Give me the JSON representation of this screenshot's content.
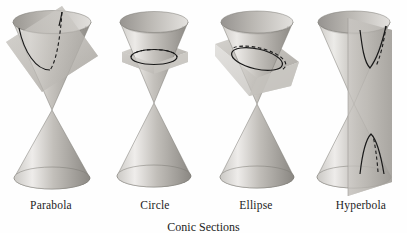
{
  "figure": {
    "caption": "Conic Sections",
    "background_color": "#fefefe",
    "ink_color": "#1c1c1c"
  },
  "palette": {
    "cone_highlight": "#f0efed",
    "cone_light": "#d8d6d2",
    "cone_mid": "#b9b6b1",
    "cone_dark": "#8e8b86",
    "cone_edge": "#7a7772",
    "plane_light": "#d3d1cd",
    "plane_mid": "#c0bdb8",
    "plane_dark": "#a7a49f",
    "curve_color": "#1a1a1a"
  },
  "panels": [
    {
      "id": "parabola",
      "label": "Parabola",
      "curve_type": "parabola",
      "plane_orientation": "parallel-to-slant-side",
      "cutting_plane": "tilted-plane",
      "intersects_nappes": 1,
      "curve_front_style": "solid",
      "curve_back_style": "dashed"
    },
    {
      "id": "circle",
      "label": "Circle",
      "curve_type": "circle",
      "plane_orientation": "perpendicular-to-axis",
      "cutting_plane": "horizontal-plane",
      "intersects_nappes": 1,
      "curve_front_style": "solid",
      "curve_back_style": "dashed"
    },
    {
      "id": "ellipse",
      "label": "Ellipse",
      "curve_type": "ellipse",
      "plane_orientation": "oblique-to-axis",
      "cutting_plane": "tilted-plane",
      "intersects_nappes": 1,
      "curve_front_style": "solid",
      "curve_back_style": "dashed"
    },
    {
      "id": "hyperbola",
      "label": "Hyperbola",
      "curve_type": "hyperbola",
      "plane_orientation": "parallel-to-axis",
      "cutting_plane": "vertical-plane",
      "intersects_nappes": 2,
      "curve_front_style": "solid",
      "curve_back_style": "dashed"
    }
  ]
}
